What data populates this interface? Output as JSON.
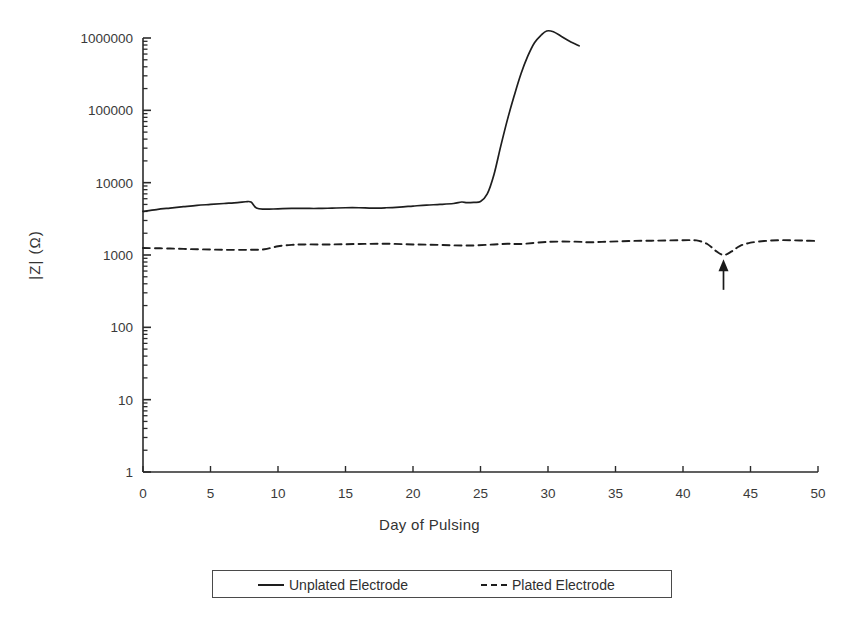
{
  "chart_data": {
    "type": "line",
    "title": "",
    "xlabel": "Day of Pulsing",
    "ylabel": "|Z| (Ω)",
    "yscale": "log",
    "xlim": [
      0,
      50
    ],
    "ylim": [
      1,
      1000000
    ],
    "grid": false,
    "legend_position": "bottom",
    "xticks": [
      "0",
      "5",
      "10",
      "15",
      "20",
      "25",
      "30",
      "35",
      "40",
      "45",
      "50"
    ],
    "xtick_values": [
      0,
      5,
      10,
      15,
      20,
      25,
      30,
      35,
      40,
      45,
      50
    ],
    "yticks": [
      "1",
      "10",
      "100",
      "1000",
      "10000",
      "100000",
      "1000000"
    ],
    "ytick_values": [
      1,
      10,
      100,
      1000,
      10000,
      100000,
      1000000
    ],
    "series": [
      {
        "name": "Unplated Electrode",
        "style": "solid",
        "color": "#1e1e1e",
        "x": [
          0,
          1,
          2,
          3,
          4,
          5,
          6,
          7,
          7.6,
          8,
          8.4,
          9,
          10,
          11,
          12,
          13,
          14,
          15,
          16,
          17,
          18,
          19,
          20,
          21,
          22,
          23,
          23.6,
          24,
          24.5,
          25,
          25.5,
          26,
          26.5,
          27,
          27.5,
          28,
          28.5,
          29,
          29.5,
          29.9,
          30.4,
          31,
          31.6,
          32.3
        ],
        "y": [
          4000,
          4250,
          4450,
          4650,
          4850,
          5000,
          5150,
          5300,
          5450,
          5400,
          4450,
          4300,
          4350,
          4400,
          4400,
          4400,
          4450,
          4500,
          4500,
          4450,
          4500,
          4600,
          4750,
          4900,
          5000,
          5150,
          5400,
          5300,
          5350,
          5500,
          7000,
          13000,
          32000,
          75000,
          160000,
          320000,
          560000,
          860000,
          1100000,
          1250000,
          1220000,
          1050000,
          900000,
          780000
        ]
      },
      {
        "name": "Plated Electrode",
        "style": "dashed",
        "color": "#1e1e1e",
        "x": [
          0,
          2,
          4,
          6,
          8,
          9,
          10,
          11,
          12,
          14,
          16,
          18,
          20,
          22,
          24,
          26,
          27,
          28,
          30,
          32,
          33,
          34,
          36,
          38,
          40,
          41,
          41.8,
          42.4,
          43,
          43.6,
          44.2,
          45,
          46,
          47,
          48,
          49,
          50
        ],
        "y": [
          1250,
          1230,
          1200,
          1180,
          1180,
          1200,
          1320,
          1380,
          1400,
          1400,
          1420,
          1430,
          1400,
          1380,
          1350,
          1400,
          1430,
          1420,
          1520,
          1530,
          1500,
          1520,
          1560,
          1580,
          1600,
          1590,
          1420,
          1150,
          1000,
          1120,
          1330,
          1480,
          1560,
          1600,
          1600,
          1580,
          1560
        ]
      }
    ],
    "annotations": [
      {
        "type": "arrow",
        "name": "failure-event-arrow",
        "direction": "up",
        "x": 43,
        "y_tail": 330,
        "y_head": 870,
        "label": ""
      }
    ]
  },
  "legend": {
    "entries": [
      {
        "label": "Unplated Electrode",
        "style": "solid"
      },
      {
        "label": "Plated Electrode",
        "style": "dashed"
      }
    ]
  },
  "axes": {
    "x_title": "Day of Pulsing",
    "y_title": "|Z| (Ω)"
  }
}
